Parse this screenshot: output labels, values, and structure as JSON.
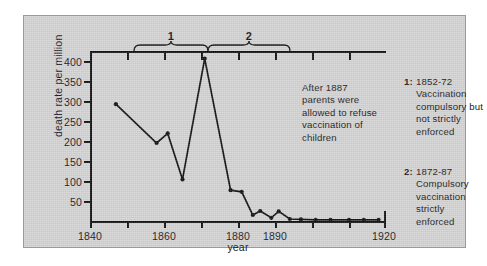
{
  "chart_data": {
    "type": "line",
    "title": "",
    "xlabel": "year",
    "ylabel": "death rate per million",
    "xlim": [
      1840,
      1920
    ],
    "ylim": [
      0,
      425
    ],
    "yticks": [
      50,
      100,
      150,
      200,
      250,
      300,
      350,
      400
    ],
    "ytick_labels": [
      "50",
      "100",
      "150",
      "200",
      "250",
      "300",
      "350",
      "400"
    ],
    "xticks": [
      1840,
      1850,
      1860,
      1870,
      1880,
      1890,
      1900,
      1910,
      1920
    ],
    "xtick_labels": [
      "1840",
      "",
      "1860",
      "",
      "1880",
      "1890",
      "",
      "",
      "1920"
    ],
    "grid": false,
    "legend_position": "right",
    "series": [
      {
        "name": "death rate per million",
        "marker": "filled-circle",
        "color": "#111111",
        "x": [
          1847,
          1858,
          1861,
          1865,
          1871,
          1878,
          1881,
          1884,
          1886,
          1889,
          1891,
          1894,
          1897,
          1901,
          1905,
          1910,
          1914,
          1918
        ],
        "y": [
          292,
          195,
          219,
          104,
          406,
          77,
          73,
          15,
          25,
          8,
          24,
          5,
          4,
          3,
          3,
          3,
          3,
          3
        ]
      }
    ],
    "annotations": [
      {
        "name": "center-note",
        "text": "After 1887 parents were allowed to refuse vaccination of children",
        "lines": [
          "After 1887",
          "parents were",
          "allowed to refuse",
          "vaccination of",
          "children"
        ]
      },
      {
        "name": "legend-1",
        "key": "1:",
        "lines": [
          "1852-72",
          "Vaccination",
          "compulsory but",
          "not strictly",
          "enforced"
        ]
      },
      {
        "name": "legend-2",
        "key": "2:",
        "lines": [
          "1872-87",
          "Compulsory",
          "vaccination",
          "strictly",
          "enforced"
        ]
      }
    ],
    "braces": [
      {
        "label": "1",
        "start": 1852,
        "end": 1872
      },
      {
        "label": "2",
        "start": 1872,
        "end": 1887
      }
    ]
  },
  "axes": {
    "ylabel": "death rate per million",
    "xlabel": "year",
    "ytick_labels": [
      "400",
      "350",
      "300",
      "250",
      "200",
      "150",
      "100",
      "50"
    ],
    "xtick_labels": [
      "1840",
      "1860",
      "1880",
      "1890",
      "1920"
    ]
  },
  "braces": {
    "label_1": "1",
    "label_2": "2"
  },
  "notes": {
    "center": {
      "l1": "After 1887",
      "l2": "parents were",
      "l3": "allowed to refuse",
      "l4": "vaccination of",
      "l5": "children"
    },
    "legend1": {
      "key": "1:",
      "l1": "1852-72",
      "l2": "Vaccination",
      "l3": "compulsory but",
      "l4": "not strictly",
      "l5": "enforced"
    },
    "legend2": {
      "key": "2:",
      "l1": "1872-87",
      "l2": "Compulsory",
      "l3": "vaccination",
      "l4": "strictly",
      "l5": "enforced"
    }
  },
  "colors": {
    "panel": "#d4d4d4",
    "ink": "#111111"
  }
}
